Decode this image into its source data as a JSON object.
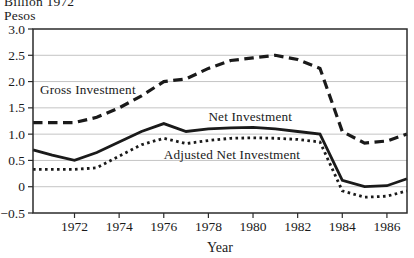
{
  "header": {
    "unit_line1": "Billion 1972",
    "unit_line2": "Pesos"
  },
  "chart_data": {
    "type": "line",
    "title": "",
    "xlabel": "Year",
    "ylabel": "Billion 1972 Pesos",
    "xlim": [
      1970.14,
      1986.9
    ],
    "ylim": [
      -0.5,
      3.0
    ],
    "grid": true,
    "frame": true,
    "legend_position": "inline-labels",
    "x_ticks": [
      1972,
      1974,
      1976,
      1978,
      1980,
      1982,
      1984,
      1986
    ],
    "x_tick_labels": [
      "1972",
      "1974",
      "1976",
      "1978",
      "1980",
      "1982",
      "1984",
      "1986"
    ],
    "y_ticks": [
      3.0,
      2.5,
      2.0,
      1.5,
      1.0,
      0.5,
      0,
      -0.5
    ],
    "y_tick_labels": [
      "3.0",
      "2.5",
      "2.0",
      "1.5",
      "1.0",
      "0.5",
      "0",
      "−0.5"
    ],
    "colors": {
      "line": "#1a1a1a",
      "grid": "#c4c4c4",
      "frame": "#2b2b2b",
      "text": "#1a1a1a",
      "background": "#ffffff"
    },
    "series": [
      {
        "name": "Gross Investment",
        "style": "dashed",
        "x": [
          1970.14,
          1971,
          1972,
          1973,
          1974,
          1975,
          1976,
          1977,
          1978,
          1979,
          1980,
          1981,
          1982,
          1983,
          1984,
          1985,
          1986,
          1986.9
        ],
        "values": [
          1.22,
          1.22,
          1.22,
          1.32,
          1.5,
          1.73,
          2.0,
          2.05,
          2.25,
          2.4,
          2.45,
          2.5,
          2.42,
          2.25,
          1.05,
          0.83,
          0.87,
          1.0
        ]
      },
      {
        "name": "Net Investment",
        "style": "solid",
        "x": [
          1970.14,
          1971,
          1972,
          1973,
          1974,
          1975,
          1976,
          1977,
          1978,
          1979,
          1980,
          1981,
          1982,
          1983,
          1984,
          1985,
          1986,
          1986.9
        ],
        "values": [
          0.7,
          0.6,
          0.5,
          0.65,
          0.85,
          1.05,
          1.2,
          1.05,
          1.1,
          1.12,
          1.13,
          1.1,
          1.05,
          1.0,
          0.12,
          0.0,
          0.02,
          0.15
        ]
      },
      {
        "name": "Adjusted Net Investment",
        "style": "dotted",
        "x": [
          1970.14,
          1971,
          1972,
          1973,
          1974,
          1975,
          1976,
          1977,
          1978,
          1979,
          1980,
          1981,
          1982,
          1983,
          1984,
          1985,
          1986,
          1986.9
        ],
        "values": [
          0.33,
          0.33,
          0.33,
          0.36,
          0.58,
          0.8,
          0.92,
          0.82,
          0.88,
          0.92,
          0.93,
          0.92,
          0.9,
          0.85,
          -0.08,
          -0.2,
          -0.18,
          -0.08
        ]
      }
    ],
    "annotations": [
      {
        "text": "Gross Investment",
        "x": 1970.45,
        "y": 1.85,
        "anchor": "start"
      },
      {
        "text": "Net Investment",
        "x": 1978.0,
        "y": 1.34,
        "anchor": "start"
      },
      {
        "text": "Adjusted Net Investment",
        "x": 1976.0,
        "y": 0.62,
        "anchor": "start"
      }
    ]
  }
}
